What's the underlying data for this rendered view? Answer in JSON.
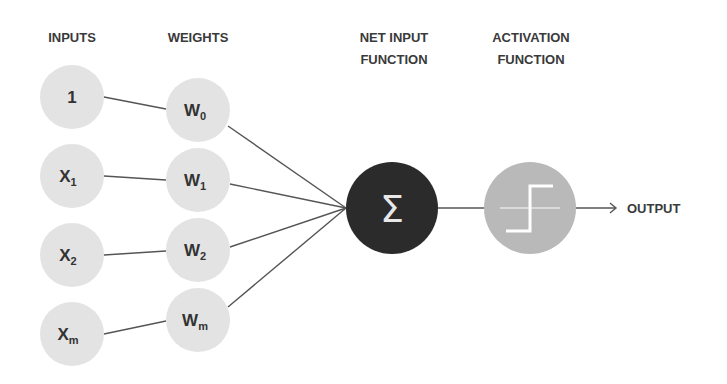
{
  "headers": {
    "inputs": "INPUTS",
    "weights": "WEIGHTS",
    "net_input_line1": "NET INPUT",
    "net_input_line2": "FUNCTION",
    "activation_line1": "ACTIVATION",
    "activation_line2": "FUNCTION"
  },
  "inputs": [
    {
      "main": "1",
      "sub": ""
    },
    {
      "main": "X",
      "sub": "1"
    },
    {
      "main": "X",
      "sub": "2"
    },
    {
      "main": "X",
      "sub": "m"
    }
  ],
  "weights": [
    {
      "main": "W",
      "sub": "0"
    },
    {
      "main": "W",
      "sub": "1"
    },
    {
      "main": "W",
      "sub": "2"
    },
    {
      "main": "W",
      "sub": "m"
    }
  ],
  "net_input": {
    "symbol": "Σ"
  },
  "activation": {
    "icon": "step-function-icon"
  },
  "output": {
    "label": "OUTPUT"
  },
  "colors": {
    "node_fill": "#e3e3e3",
    "sum_fill": "#2b2b2b",
    "activation_fill": "#b9b9b9",
    "edge": "#555555",
    "text": "#333333"
  }
}
